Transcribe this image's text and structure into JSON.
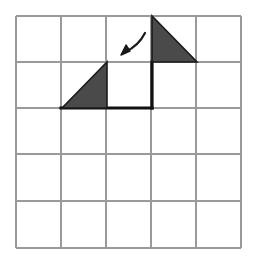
{
  "figure": {
    "background_color": "#ffffff",
    "canvas": {
      "width": 256,
      "height": 259
    }
  },
  "grid": {
    "name": "five-by-five-grid",
    "columns": 5,
    "rows": 5,
    "x_lines": [
      16,
      61,
      106,
      151,
      196,
      241
    ],
    "y_lines": [
      16,
      62,
      108,
      154,
      201,
      248
    ],
    "cell_width": 45,
    "cell_height": 46,
    "line_color": "#9a9a9a",
    "line_width": 1.2,
    "border_color": "#9a9a9a"
  },
  "shapes": {
    "triangles": [
      {
        "name": "upper-right-triangle",
        "label": "shaded right triangle, row 1 column 4",
        "points": "152,16 152,62 197,62",
        "right_angle_corner": "top-left",
        "fill": "#4a4a4a",
        "stroke": "#1a1a1a",
        "stroke_width": 1.6,
        "cell_row": 1,
        "cell_col": 4
      },
      {
        "name": "lower-left-triangle",
        "label": "shaded right triangle, row 2 column 2",
        "points": "62,108 107,62 107,108",
        "right_angle_corner": "bottom-right",
        "fill": "#4a4a4a",
        "stroke": "#1a1a1a",
        "stroke_width": 1.6,
        "cell_row": 2,
        "cell_col": 2
      }
    ],
    "bold_lines": [
      {
        "name": "bold-horizontal-baseline",
        "x1": 61,
        "y1": 108,
        "x2": 152,
        "y2": 108,
        "color": "#111111",
        "width": 3.2
      },
      {
        "name": "bold-vertical-edge",
        "x1": 152,
        "y1": 62,
        "x2": 152,
        "y2": 108,
        "color": "#111111",
        "width": 3.2
      }
    ],
    "arrow": {
      "name": "curved-arrow",
      "label": "curved arrow pointing down-left",
      "path": "M 145,33 C 141,41 134,48 125,52",
      "head": "121,55 130,51 126,45",
      "color": "#1a1a1a",
      "width": 2.2,
      "direction": "down-left"
    }
  }
}
